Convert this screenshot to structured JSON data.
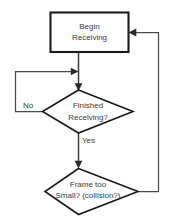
{
  "diagram": {
    "type": "flowchart",
    "nodes": [
      {
        "id": "begin-receiving",
        "shape": "rectangle",
        "line1": "Begin",
        "line2": "Receiving"
      },
      {
        "id": "finished-receiving",
        "shape": "diamond",
        "line1": "Finished",
        "line2": "Receiving?"
      },
      {
        "id": "frame-too-small",
        "shape": "diamond",
        "line1": "Frame too",
        "line2": "Small? (collision?)"
      }
    ],
    "edge_labels": {
      "no": "No",
      "yes": "Yes"
    },
    "colors": {
      "background": "#ffffff",
      "shape_fill": "#ffffff",
      "shape_stroke": "#1a1a1a",
      "connector": "#4a4a4a",
      "text": "#3a3a3a"
    }
  }
}
